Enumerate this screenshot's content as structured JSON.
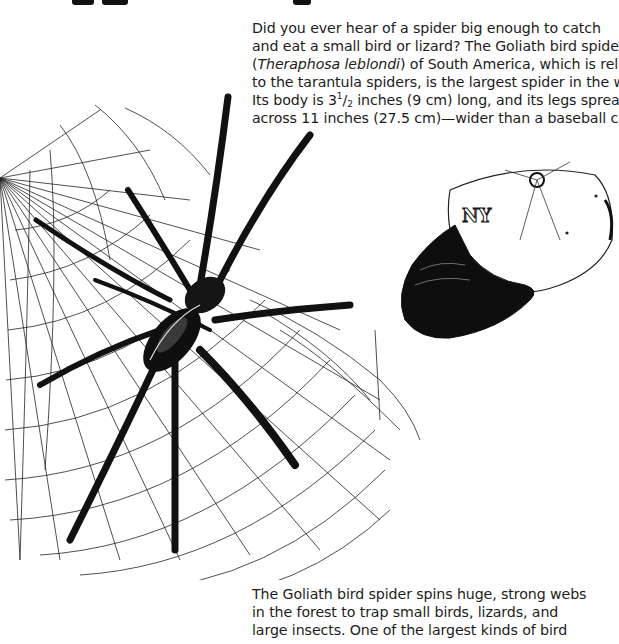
{
  "header": {
    "title_fragments_visible": true
  },
  "intro_paragraph": {
    "lines": [
      "Did you ever hear of a spider big enough to catch",
      "and eat a small bird or lizard? The Goliath bird spider",
      {
        "open_paren": "(",
        "species": "Theraphosa leblondi",
        "rest": ") of South America, which is related"
      },
      "to the tarantula spiders, is the largest spider in the world.",
      {
        "before": "Its body is 3",
        "frac_num": "1",
        "frac_sep": "/",
        "frac_den": "2",
        "after": " inches (9 cm) long, and its legs spread"
      },
      "across 11 inches (27.5 cm)—wider than a baseball cap."
    ]
  },
  "second_paragraph": {
    "lines": [
      "The Goliath bird spider spins huge, strong webs",
      "in the forest to trap small birds, lizards, and",
      "large insects. One of the largest kinds of bird"
    ]
  },
  "illustration": {
    "subjects": [
      "goliath-bird-spider",
      "spider-web",
      "baseball-cap"
    ],
    "style": "black ink pen drawing",
    "ink_color": "#111111",
    "paper_color": "#ffffff"
  }
}
